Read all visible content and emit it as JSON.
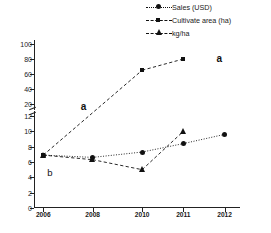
{
  "chart_data": {
    "type": "line",
    "title": "",
    "xlabel": "",
    "ylabel": "",
    "x": [
      "2006",
      "2008",
      "2010",
      "2011",
      "2012"
    ],
    "categories": [
      "2006",
      "2008",
      "2010",
      "2011",
      "2012"
    ],
    "broken_axis": true,
    "ylim_lower": [
      0,
      12
    ],
    "ylim_upper": [
      12,
      100
    ],
    "yticks_lower": [
      "0",
      "2",
      "4",
      "6",
      "8",
      "10",
      "12"
    ],
    "yticks_upper": [
      "20",
      "40",
      "60",
      "80",
      "100"
    ],
    "grid": false,
    "legend_position": "top-right",
    "series": [
      {
        "name": "Sales (USD)",
        "marker": "circle",
        "line": "dotted",
        "values": [
          6.9,
          6.6,
          7.3,
          8.4,
          9.6
        ]
      },
      {
        "name": "Cultivate area (ha)",
        "marker": "square",
        "line": "dashed",
        "values": [
          6.9,
          null,
          65,
          80,
          null
        ]
      },
      {
        "name": "kg/ha",
        "marker": "triangle",
        "line": "dashed",
        "values": [
          6.9,
          6.3,
          5.0,
          10.0,
          null
        ]
      }
    ],
    "annotations": [
      {
        "text": "a",
        "x": "2008",
        "note": "upper-left of rising cultivate line"
      },
      {
        "text": "a",
        "x": "2012",
        "note": "upper right"
      },
      {
        "text": "b",
        "x": "2006",
        "note": "lower left"
      }
    ]
  },
  "legend": {
    "items": [
      {
        "label": "Sales (USD)",
        "marker": "circle",
        "line": "dotted"
      },
      {
        "label": "Cultivate area (ha)",
        "marker": "square",
        "line": "dashed"
      },
      {
        "label": "kg/ha",
        "marker": "triangle",
        "line": "dashed"
      }
    ]
  },
  "axes": {
    "y_labels_upper": [
      "100",
      "80",
      "60",
      "40",
      "20"
    ],
    "y_labels_lower": [
      "12",
      "10",
      "8",
      "6",
      "4",
      "2",
      "0"
    ],
    "x_labels": [
      "2006",
      "2008",
      "2010",
      "2011",
      "2012"
    ]
  },
  "annotations": {
    "a_mid": "a",
    "a_right": "a",
    "b_left": "b"
  },
  "colors": {
    "ink": "#111111",
    "axis": "#222222",
    "background": "#ffffff"
  }
}
